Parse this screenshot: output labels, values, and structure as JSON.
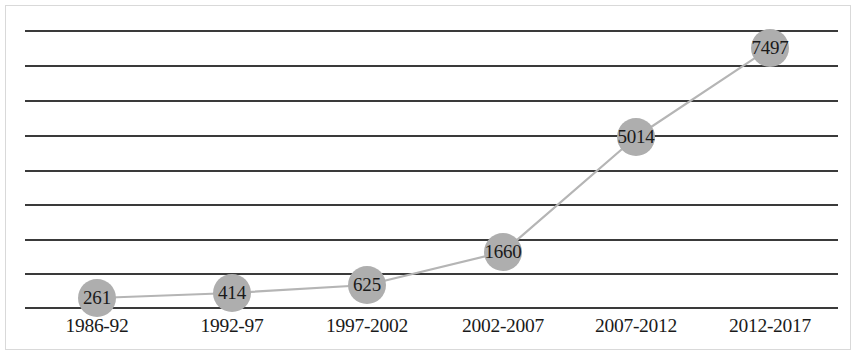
{
  "chart_data": {
    "type": "line",
    "title": "",
    "subtitle": "",
    "xlabel": "",
    "ylabel": "",
    "categories": [
      "1986-92",
      "1992-97",
      "1997-2002",
      "2002-2007",
      "2007-2012",
      "2012-2017"
    ],
    "values": [
      261,
      414,
      625,
      1660,
      5014,
      7497
    ],
    "data_labels": [
      "261",
      "414",
      "625",
      "1660",
      "5014",
      "7497"
    ],
    "series": [
      {
        "name": "",
        "values": [
          261,
          414,
          625,
          1660,
          5014,
          7497
        ]
      }
    ],
    "ylim": [
      0,
      8000
    ],
    "ytick_labels": [],
    "gridline_count": 9,
    "gridline_interval": 1000,
    "grid": "horizontal",
    "legend": "none",
    "marker": "circle",
    "colors": {
      "marker_fill": "#aeaeae",
      "line": "#b5b5b5",
      "gridline": "#3a3a3a",
      "label_text": "#1a1a1a",
      "background": "#ffffff",
      "frame_border": "#d9d9d9"
    }
  },
  "geometry": {
    "plot_left": 25,
    "plot_right": 838,
    "baseline_y": 308,
    "top_gridline_y": 31,
    "gridline_ys": [
      31,
      66,
      101,
      136,
      171,
      205,
      240,
      274,
      308
    ],
    "point_x": [
      97,
      232,
      367,
      503,
      636,
      770
    ],
    "point_y": [
      298,
      293,
      285,
      252,
      137,
      48
    ],
    "category_x": [
      97,
      232,
      367,
      503,
      636,
      770
    ],
    "category_label_y": 332
  }
}
